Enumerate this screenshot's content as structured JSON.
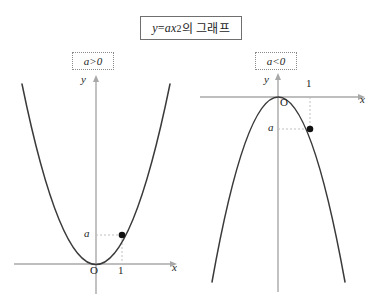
{
  "figure": {
    "title": {
      "formula_lhs": "y",
      "formula_eq": "=",
      "formula_coeff": "ax",
      "formula_exponent": "2",
      "suffix": "의 그래프",
      "full_text": "y=ax2의 그래프"
    },
    "panels": [
      {
        "id": "left",
        "condition_label": "a>0",
        "axis_labels": {
          "x": "x",
          "y": "y"
        },
        "origin_label": "O",
        "x_tick_label": "1",
        "y_tick_label": "a",
        "curve_direction": "opens-upward",
        "point_label": "(1, a)"
      },
      {
        "id": "right",
        "condition_label": "a<0",
        "axis_labels": {
          "x": "x",
          "y": "y"
        },
        "origin_label": "O",
        "x_tick_label": "1",
        "y_tick_label": "a",
        "curve_direction": "opens-downward",
        "point_label": "(1, a)"
      }
    ],
    "colors": {
      "curve": "#3a3a3a",
      "axis": "#a8a8a8",
      "guide": "#c0c0c0",
      "point": "#111111",
      "title_border": "#6f6f6f",
      "cond_border": "#8a8a8a",
      "background": "#ffffff"
    }
  }
}
